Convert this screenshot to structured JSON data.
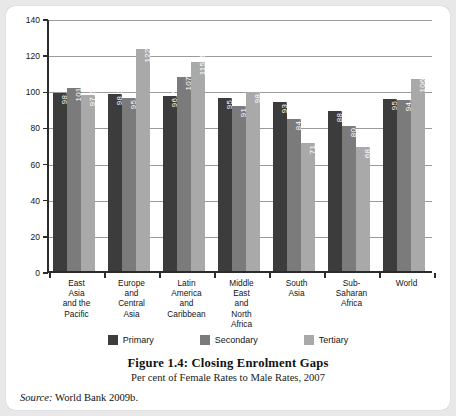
{
  "figure": {
    "title": "Figure 1.4: Closing Enrolment Gaps",
    "subtitle": "Per cent of Female Rates to Male Rates, 2007",
    "source_word": "Source:",
    "source_text": "World Bank 2009b."
  },
  "legend": {
    "items": [
      {
        "label": "Primary",
        "color": "#3c3c3c"
      },
      {
        "label": "Secondary",
        "color": "#7b7b7b"
      },
      {
        "label": "Tertiary",
        "color": "#a9a9a9"
      }
    ]
  },
  "chart_data": {
    "type": "bar",
    "title": "Figure 1.4: Closing Enrolment Gaps",
    "subtitle": "Per cent of Female Rates to Male Rates, 2007",
    "xlabel": "",
    "ylabel": "",
    "ylim": [
      0,
      140
    ],
    "yticks": [
      0,
      20,
      40,
      60,
      80,
      100,
      120,
      140
    ],
    "ytick_labels": [
      "0",
      "20",
      "40",
      "60",
      "80",
      "100",
      "120",
      "140"
    ],
    "grid": true,
    "legend_position": "bottom",
    "categories": [
      "East Asia and the Pacific",
      "Europe and Central Asia",
      "Latin America and Caribbean",
      "Middle East and North Africa",
      "South Asia",
      "Sub-Saharan Africa",
      "World"
    ],
    "category_lines": [
      [
        "East",
        "Asia",
        "and the",
        "Pacific"
      ],
      [
        "Europe",
        "and",
        "Central",
        "Asia"
      ],
      [
        "Latin",
        "America",
        "and",
        "Caribbean"
      ],
      [
        "Middle",
        "East",
        "and",
        "North",
        "Africa"
      ],
      [
        "South",
        "Asia"
      ],
      [
        "Sub-",
        "Saharan",
        "Africa"
      ],
      [
        "World"
      ]
    ],
    "series": [
      {
        "name": "Primary",
        "color": "#3c3c3c",
        "values": [
          98.6,
          98.1,
          96.7,
          95.8,
          93.6,
          88.8,
          95.1
        ],
        "labels": [
          "98.6",
          "98.1",
          "96.7",
          "95.8",
          "93.6",
          "88.8",
          "95.1"
        ]
      },
      {
        "name": "Secondary",
        "color": "#7b7b7b",
        "values": [
          101.0,
          95.7,
          107.3,
          91.5,
          84.0,
          80.3,
          94.9
        ],
        "labels": [
          "101.0",
          "95.7",
          "107.3",
          "91.5",
          "84.0",
          "80.3",
          "94.9"
        ]
      },
      {
        "name": "Tertiary",
        "color": "#a9a9a9",
        "values": [
          97.5,
          122.7,
          115.6,
          98.8,
          71.1,
          68.5,
          106.1
        ],
        "labels": [
          "97.5",
          "122.7",
          "115.6",
          "98.8",
          "71.1",
          "68.5",
          "106.1"
        ]
      }
    ]
  }
}
